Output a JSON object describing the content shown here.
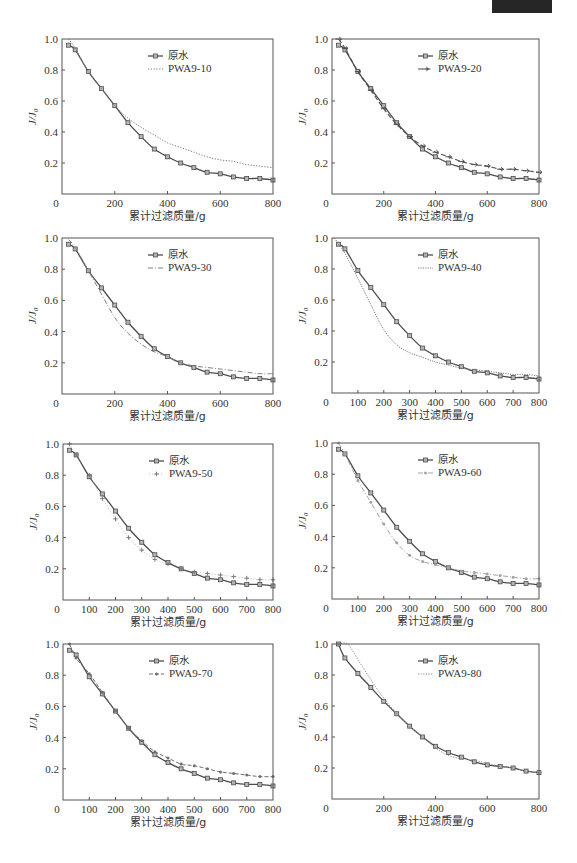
{
  "chart_data": [
    {
      "type": "line",
      "title": "",
      "xlabel": "累计过滤质量/g",
      "ylabel": "J/J0",
      "ylabel_parts": {
        "main": "J/J",
        "sub": "0"
      },
      "xlim": [
        0,
        800
      ],
      "ylim": [
        0,
        1.0
      ],
      "x_ticks": [
        0,
        200,
        400,
        600,
        800
      ],
      "y_ticks": [
        0.2,
        0.4,
        0.6,
        0.8,
        1.0
      ],
      "y_tick_labels": [
        "0.2",
        "0.4",
        "0.6",
        "0.8",
        "1.0"
      ],
      "grid": false,
      "legend_position": "upper center",
      "series": [
        {
          "name": "原水",
          "x": [
            25,
            50,
            100,
            150,
            200,
            250,
            300,
            350,
            400,
            450,
            500,
            550,
            600,
            650,
            700,
            750,
            800
          ],
          "y": [
            0.96,
            0.93,
            0.79,
            0.68,
            0.57,
            0.46,
            0.37,
            0.29,
            0.24,
            0.2,
            0.17,
            0.14,
            0.13,
            0.11,
            0.1,
            0.1,
            0.09
          ],
          "style": {
            "color": "#4d4d4d",
            "width": 1.3,
            "dash": "",
            "marker": "square"
          }
        },
        {
          "name": "PWA9-10",
          "x": [
            25,
            50,
            100,
            150,
            200,
            250,
            300,
            350,
            400,
            450,
            500,
            550,
            600,
            650,
            700,
            750,
            800
          ],
          "y": [
            1.0,
            0.94,
            0.79,
            0.68,
            0.57,
            0.49,
            0.43,
            0.38,
            0.33,
            0.3,
            0.27,
            0.24,
            0.22,
            0.21,
            0.19,
            0.18,
            0.17
          ],
          "style": {
            "color": "#777777",
            "width": 1.0,
            "dash": "1.2 1.6",
            "marker": "none"
          }
        }
      ]
    },
    {
      "type": "line",
      "title": "",
      "xlabel": "累计过滤质量/g",
      "ylabel": "J/J0",
      "ylabel_parts": {
        "main": "J/J",
        "sub": "0"
      },
      "xlim": [
        0,
        800
      ],
      "ylim": [
        0,
        1.0
      ],
      "x_ticks": [
        0,
        200,
        400,
        600,
        800
      ],
      "y_ticks": [
        0.2,
        0.4,
        0.6,
        0.8,
        1.0
      ],
      "y_tick_labels": [
        "0.2",
        "0.4",
        "0.6",
        "0.8",
        "1.0"
      ],
      "grid": false,
      "legend_position": "upper center",
      "series": [
        {
          "name": "原水",
          "x": [
            25,
            50,
            100,
            150,
            200,
            250,
            300,
            350,
            400,
            450,
            500,
            550,
            600,
            650,
            700,
            750,
            800
          ],
          "y": [
            0.96,
            0.93,
            0.79,
            0.68,
            0.57,
            0.46,
            0.37,
            0.29,
            0.24,
            0.2,
            0.17,
            0.14,
            0.13,
            0.11,
            0.1,
            0.1,
            0.09
          ],
          "style": {
            "color": "#4d4d4d",
            "width": 1.3,
            "dash": "",
            "marker": "square"
          }
        },
        {
          "name": "PWA9-20",
          "x": [
            25,
            50,
            100,
            150,
            200,
            250,
            300,
            350,
            400,
            450,
            500,
            550,
            600,
            650,
            700,
            750,
            800
          ],
          "y": [
            1.0,
            0.94,
            0.79,
            0.67,
            0.55,
            0.45,
            0.37,
            0.31,
            0.27,
            0.24,
            0.21,
            0.19,
            0.18,
            0.16,
            0.16,
            0.15,
            0.14
          ],
          "style": {
            "color": "#4d4d4d",
            "width": 1.1,
            "dash": "5 2.5",
            "marker": "arrow"
          }
        }
      ]
    },
    {
      "type": "line",
      "title": "",
      "xlabel": "累计过滤质量/g",
      "ylabel": "J/J0",
      "ylabel_parts": {
        "main": "J/J",
        "sub": "0"
      },
      "xlim": [
        0,
        800
      ],
      "ylim": [
        0,
        1.0
      ],
      "x_ticks": [
        0,
        200,
        400,
        600,
        800
      ],
      "y_ticks": [
        0.2,
        0.4,
        0.6,
        0.8,
        1.0
      ],
      "y_tick_labels": [
        "0.2",
        "0.4",
        "0.6",
        "0.8",
        "1.0"
      ],
      "grid": false,
      "legend_position": "upper center",
      "series": [
        {
          "name": "原水",
          "x": [
            25,
            50,
            100,
            150,
            200,
            250,
            300,
            350,
            400,
            450,
            500,
            550,
            600,
            650,
            700,
            750,
            800
          ],
          "y": [
            0.96,
            0.93,
            0.79,
            0.68,
            0.57,
            0.46,
            0.37,
            0.29,
            0.24,
            0.2,
            0.17,
            0.14,
            0.13,
            0.11,
            0.1,
            0.1,
            0.09
          ],
          "style": {
            "color": "#4d4d4d",
            "width": 1.3,
            "dash": "",
            "marker": "square"
          }
        },
        {
          "name": "PWA9-30",
          "x": [
            25,
            50,
            100,
            150,
            200,
            250,
            300,
            350,
            400,
            450,
            500,
            550,
            600,
            650,
            700,
            750,
            800
          ],
          "y": [
            0.99,
            0.94,
            0.79,
            0.64,
            0.49,
            0.39,
            0.32,
            0.27,
            0.24,
            0.2,
            0.18,
            0.17,
            0.16,
            0.15,
            0.14,
            0.13,
            0.13
          ],
          "style": {
            "color": "#808080",
            "width": 1.0,
            "dash": "5 2 1 2",
            "marker": "none"
          }
        }
      ]
    },
    {
      "type": "line",
      "title": "",
      "xlabel": "累计过滤质量/g",
      "ylabel": "J/J0",
      "ylabel_parts": {
        "main": "J/J",
        "sub": "0"
      },
      "xlim": [
        0,
        800
      ],
      "ylim": [
        0,
        1.0
      ],
      "x_ticks": [
        0,
        100,
        200,
        300,
        400,
        500,
        600,
        700,
        800
      ],
      "y_ticks": [
        0.2,
        0.4,
        0.6,
        0.8,
        1.0
      ],
      "y_tick_labels": [
        "0.2",
        "0.4",
        "0.6",
        "0.8",
        "1.0"
      ],
      "grid": false,
      "legend_position": "upper center",
      "series": [
        {
          "name": "原水",
          "x": [
            25,
            50,
            100,
            150,
            200,
            250,
            300,
            350,
            400,
            450,
            500,
            550,
            600,
            650,
            700,
            750,
            800
          ],
          "y": [
            0.96,
            0.93,
            0.79,
            0.68,
            0.57,
            0.46,
            0.37,
            0.29,
            0.24,
            0.2,
            0.17,
            0.14,
            0.13,
            0.11,
            0.1,
            0.1,
            0.09
          ],
          "style": {
            "color": "#4d4d4d",
            "width": 1.3,
            "dash": "",
            "marker": "square"
          }
        },
        {
          "name": "PWA9-40",
          "x": [
            10,
            25,
            50,
            100,
            150,
            200,
            250,
            300,
            350,
            400,
            450,
            500,
            550,
            600,
            650,
            700,
            750,
            800
          ],
          "y": [
            1.0,
            0.96,
            0.9,
            0.74,
            0.57,
            0.41,
            0.31,
            0.26,
            0.23,
            0.2,
            0.18,
            0.16,
            0.15,
            0.14,
            0.13,
            0.12,
            0.12,
            0.11
          ],
          "style": {
            "color": "#7a7a7a",
            "width": 1.0,
            "dash": "1.2 1.2",
            "marker": "none"
          }
        }
      ]
    },
    {
      "type": "line",
      "title": "",
      "xlabel": "累计过滤质量/g",
      "ylabel": "J/J0",
      "ylabel_parts": {
        "main": "J/J",
        "sub": "0"
      },
      "xlim": [
        0,
        800
      ],
      "ylim": [
        0,
        1.0
      ],
      "x_ticks": [
        0,
        100,
        200,
        300,
        400,
        500,
        600,
        700,
        800
      ],
      "y_ticks": [
        0.2,
        0.4,
        0.6,
        0.8,
        1.0
      ],
      "y_tick_labels": [
        "0.2",
        "0.4",
        "0.6",
        "0.8",
        "1.0"
      ],
      "grid": false,
      "legend_position": "upper center",
      "series": [
        {
          "name": "原水",
          "x": [
            25,
            50,
            100,
            150,
            200,
            250,
            300,
            350,
            400,
            450,
            500,
            550,
            600,
            650,
            700,
            750,
            800
          ],
          "y": [
            0.96,
            0.93,
            0.79,
            0.68,
            0.57,
            0.46,
            0.37,
            0.29,
            0.24,
            0.2,
            0.17,
            0.14,
            0.13,
            0.11,
            0.1,
            0.1,
            0.09
          ],
          "style": {
            "color": "#4d4d4d",
            "width": 1.3,
            "dash": "",
            "marker": "square"
          }
        },
        {
          "name": "PWA9-50",
          "x": [
            25,
            50,
            100,
            150,
            200,
            250,
            300,
            350,
            400,
            450,
            500,
            550,
            600,
            650,
            700,
            750,
            800
          ],
          "y": [
            1.0,
            0.93,
            0.8,
            0.65,
            0.52,
            0.4,
            0.32,
            0.26,
            0.23,
            0.2,
            0.18,
            0.17,
            0.16,
            0.15,
            0.14,
            0.13,
            0.13
          ],
          "style": {
            "color": "#8f8f8f",
            "width": 0.6,
            "dash": "1 2",
            "marker": "plus"
          }
        }
      ]
    },
    {
      "type": "line",
      "title": "",
      "xlabel": "累计过滤质量/g",
      "ylabel": "J/J0",
      "ylabel_parts": {
        "main": "J/J",
        "sub": "0"
      },
      "xlim": [
        0,
        800
      ],
      "ylim": [
        0,
        1.0
      ],
      "x_ticks": [
        0,
        100,
        200,
        300,
        400,
        500,
        600,
        700,
        800
      ],
      "y_ticks": [
        0.2,
        0.4,
        0.6,
        0.8,
        1.0
      ],
      "y_tick_labels": [
        "0.2",
        "0.4",
        "0.6",
        "0.8",
        "1.0"
      ],
      "grid": false,
      "legend_position": "upper center",
      "series": [
        {
          "name": "原水",
          "x": [
            25,
            50,
            100,
            150,
            200,
            250,
            300,
            350,
            400,
            450,
            500,
            550,
            600,
            650,
            700,
            750,
            800
          ],
          "y": [
            0.96,
            0.93,
            0.79,
            0.68,
            0.57,
            0.46,
            0.37,
            0.29,
            0.24,
            0.2,
            0.17,
            0.14,
            0.13,
            0.11,
            0.1,
            0.1,
            0.09
          ],
          "style": {
            "color": "#4d4d4d",
            "width": 1.3,
            "dash": "",
            "marker": "square"
          }
        },
        {
          "name": "PWA9-60",
          "x": [
            25,
            50,
            100,
            150,
            200,
            250,
            300,
            350,
            400,
            450,
            500,
            550,
            600,
            650,
            700,
            750,
            800
          ],
          "y": [
            1.0,
            0.93,
            0.76,
            0.62,
            0.48,
            0.36,
            0.28,
            0.24,
            0.22,
            0.2,
            0.18,
            0.17,
            0.16,
            0.15,
            0.14,
            0.13,
            0.13
          ],
          "style": {
            "color": "#a3a3a3",
            "width": 1.0,
            "dash": "5 2 1 2",
            "marker": "dot"
          }
        }
      ]
    },
    {
      "type": "line",
      "title": "",
      "xlabel": "累计过滤质量/g",
      "ylabel": "J/J0",
      "ylabel_parts": {
        "main": "J/J",
        "sub": "0"
      },
      "xlim": [
        0,
        800
      ],
      "ylim": [
        0,
        1.0
      ],
      "x_ticks": [
        0,
        100,
        200,
        300,
        400,
        500,
        600,
        700,
        800
      ],
      "y_ticks": [
        0.2,
        0.4,
        0.6,
        0.8,
        1.0
      ],
      "y_tick_labels": [
        "0.2",
        "0.4",
        "0.6",
        "0.8",
        "1.0"
      ],
      "grid": false,
      "legend_position": "upper center",
      "series": [
        {
          "name": "原水",
          "x": [
            25,
            50,
            100,
            150,
            200,
            250,
            300,
            350,
            400,
            450,
            500,
            550,
            600,
            650,
            700,
            750,
            800
          ],
          "y": [
            0.96,
            0.93,
            0.79,
            0.68,
            0.57,
            0.46,
            0.37,
            0.29,
            0.24,
            0.2,
            0.17,
            0.14,
            0.13,
            0.11,
            0.1,
            0.1,
            0.09
          ],
          "style": {
            "color": "#4d4d4d",
            "width": 1.3,
            "dash": "",
            "marker": "square"
          }
        },
        {
          "name": "PWA9-70",
          "x": [
            25,
            50,
            100,
            150,
            200,
            250,
            300,
            350,
            400,
            450,
            500,
            550,
            600,
            650,
            700,
            750,
            800
          ],
          "y": [
            1.0,
            0.91,
            0.81,
            0.69,
            0.57,
            0.46,
            0.38,
            0.31,
            0.27,
            0.23,
            0.22,
            0.2,
            0.18,
            0.17,
            0.16,
            0.15,
            0.15
          ],
          "style": {
            "color": "#6e6e6e",
            "width": 1.0,
            "dash": "4 2",
            "marker": "dot"
          }
        }
      ]
    },
    {
      "type": "line",
      "title": "",
      "xlabel": "累计过滤质量/g",
      "ylabel": "J/J0",
      "ylabel_parts": {
        "main": "J/J",
        "sub": "0"
      },
      "xlim": [
        0,
        800
      ],
      "ylim": [
        0,
        1.0
      ],
      "x_ticks": [
        0,
        200,
        400,
        600,
        800
      ],
      "y_ticks": [
        0.2,
        0.4,
        0.6,
        0.8,
        1.0
      ],
      "y_tick_labels": [
        "0.2",
        "0.4",
        "0.6",
        "0.8",
        "1.0"
      ],
      "grid": false,
      "legend_position": "upper center",
      "series": [
        {
          "name": "原水",
          "x": [
            25,
            50,
            100,
            150,
            200,
            250,
            300,
            350,
            400,
            450,
            500,
            550,
            600,
            650,
            700,
            750,
            800
          ],
          "y": [
            1.0,
            0.91,
            0.81,
            0.72,
            0.63,
            0.55,
            0.47,
            0.4,
            0.34,
            0.3,
            0.27,
            0.24,
            0.22,
            0.21,
            0.2,
            0.18,
            0.17
          ],
          "style": {
            "color": "#4d4d4d",
            "width": 1.3,
            "dash": "",
            "marker": "square"
          }
        },
        {
          "name": "PWA9-80",
          "x": [
            25,
            60,
            100,
            150,
            200,
            250,
            300,
            350,
            400,
            450,
            500,
            550,
            600,
            650,
            700,
            750,
            800
          ],
          "y": [
            1.0,
            1.0,
            0.9,
            0.77,
            0.65,
            0.55,
            0.47,
            0.4,
            0.33,
            0.28,
            0.26,
            0.25,
            0.23,
            0.21,
            0.2,
            0.18,
            0.17
          ],
          "style": {
            "color": "#8a8a8a",
            "width": 1.0,
            "dash": "1.2 1.4",
            "marker": "none"
          }
        }
      ]
    }
  ]
}
